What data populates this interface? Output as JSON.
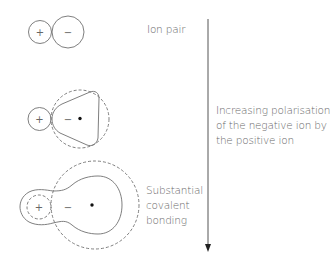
{
  "diagram": {
    "stages": [
      {
        "id": "ion-pair",
        "label": "Ion pair",
        "cation_sign": "+",
        "anion_sign": "−"
      },
      {
        "id": "polarised",
        "label": "",
        "cation_sign": "+",
        "anion_sign": "−"
      },
      {
        "id": "covalent",
        "label_lines": [
          "Substantial",
          "covalent",
          "bonding"
        ],
        "cation_sign": "+",
        "anion_sign": "−"
      }
    ],
    "arrow": {
      "direction": "down",
      "label_lines": [
        "Increasing polarisation",
        "of the negative ion by",
        "the positive ion"
      ]
    },
    "colors": {
      "stroke": "#6e6e6e",
      "text": "#6a6a6a",
      "dot": "#111111"
    }
  }
}
